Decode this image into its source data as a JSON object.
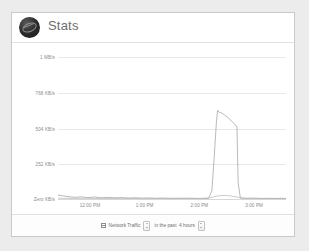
{
  "header": {
    "title": "Stats",
    "avatar_icon": "avatar-circle-icon"
  },
  "chart_data": {
    "type": "line",
    "title": "Stats",
    "xlabel": "",
    "ylabel": "",
    "grid": true,
    "legend_position": "bottom",
    "ylim": [
      0,
      1024
    ],
    "ytick_values": [
      1024,
      768,
      504,
      252,
      0
    ],
    "ytick_labels": [
      "1 MB/s",
      "768 KB/s",
      "504 KB/s",
      "252 KB/s",
      "Zero KB/s"
    ],
    "xtick_labels": [
      "12:00 PM",
      "1:00 PM",
      "2:00 PM",
      "3:00 PM"
    ],
    "xtick_positions": [
      0.14,
      0.38,
      0.62,
      0.86
    ],
    "series": [
      {
        "name": "Outbound Traffic",
        "color": "#9b9b9b",
        "x": [
          0.0,
          0.02,
          0.04,
          0.06,
          0.08,
          0.1,
          0.13,
          0.16,
          0.19,
          0.22,
          0.25,
          0.28,
          0.31,
          0.34,
          0.37,
          0.4,
          0.43,
          0.46,
          0.49,
          0.52,
          0.55,
          0.58,
          0.61,
          0.64,
          0.66,
          0.675,
          0.685,
          0.695,
          0.7,
          0.705,
          0.715,
          0.725,
          0.735,
          0.745,
          0.755,
          0.765,
          0.775,
          0.785,
          0.79,
          0.8,
          0.83,
          0.86,
          0.89,
          0.92,
          0.95,
          0.98,
          1.0
        ],
        "y": [
          28,
          24,
          18,
          14,
          12,
          16,
          10,
          14,
          9,
          12,
          8,
          10,
          7,
          9,
          6,
          8,
          5,
          7,
          5,
          6,
          5,
          6,
          4,
          5,
          4,
          60,
          300,
          560,
          640,
          628,
          622,
          612,
          600,
          588,
          572,
          556,
          540,
          520,
          120,
          6,
          5,
          6,
          4,
          5,
          4,
          5,
          4
        ]
      },
      {
        "name": "Inbound Traffic",
        "color": "#b4b4b4",
        "x": [
          0.0,
          0.04,
          0.08,
          0.12,
          0.16,
          0.2,
          0.24,
          0.28,
          0.32,
          0.36,
          0.4,
          0.44,
          0.48,
          0.52,
          0.56,
          0.6,
          0.64,
          0.67,
          0.7,
          0.73,
          0.76,
          0.79,
          0.82,
          0.86,
          0.9,
          0.94,
          0.98,
          1.0
        ],
        "y": [
          6,
          5,
          4,
          5,
          4,
          3,
          4,
          3,
          4,
          3,
          3,
          4,
          3,
          3,
          4,
          3,
          4,
          10,
          22,
          26,
          22,
          12,
          5,
          4,
          3,
          4,
          3,
          3
        ]
      }
    ]
  },
  "legend": [
    {
      "label": "Outbound Traffic"
    },
    {
      "label": "Inbound Traffic"
    }
  ],
  "footer": {
    "metric_label": "Network Traffic",
    "metric_icon": "chart-icon",
    "metric_dropdown_icon": "stepper-icon",
    "past_label": "in the past",
    "range_value": "4 hours",
    "range_dropdown_icon": "stepper-icon"
  }
}
